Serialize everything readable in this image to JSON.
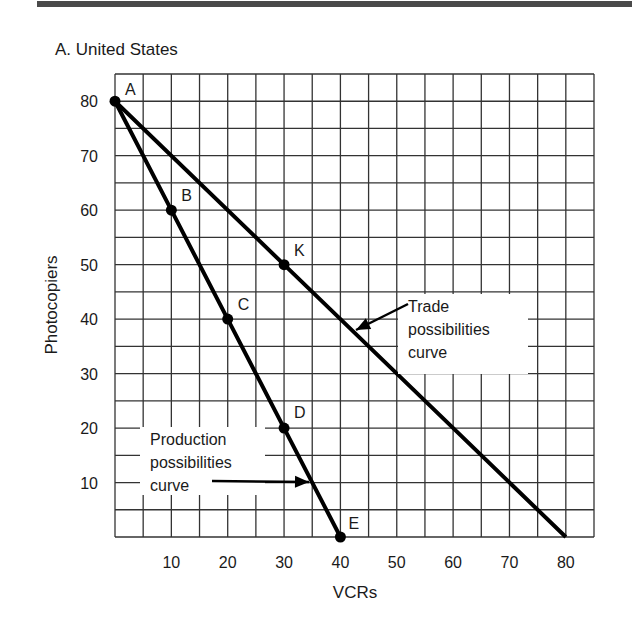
{
  "panel": {
    "title": "A. United States"
  },
  "chart_data": {
    "type": "line",
    "title": "A. United States",
    "xlabel": "VCRs",
    "ylabel": "Photocopiers",
    "xlim": [
      0,
      85
    ],
    "ylim": [
      0,
      85
    ],
    "grid": true,
    "grid_step": 5,
    "x_ticks": [
      10,
      20,
      30,
      40,
      50,
      60,
      70,
      80
    ],
    "y_ticks": [
      10,
      20,
      30,
      40,
      50,
      60,
      70,
      80
    ],
    "series": [
      {
        "name": "Production possibilities curve",
        "points": [
          {
            "label": "A",
            "x": 0,
            "y": 80
          },
          {
            "label": "B",
            "x": 10,
            "y": 60
          },
          {
            "label": "C",
            "x": 20,
            "y": 40
          },
          {
            "label": "D",
            "x": 30,
            "y": 20
          },
          {
            "label": "E",
            "x": 40,
            "y": 0
          }
        ]
      },
      {
        "name": "Trade possibilities curve",
        "points": [
          {
            "label": "A",
            "x": 0,
            "y": 80
          },
          {
            "label": "K",
            "x": 30,
            "y": 50
          },
          {
            "label": "",
            "x": 80,
            "y": 0
          }
        ]
      }
    ],
    "annotations": [
      {
        "text": [
          "Trade",
          "possibilities",
          "curve"
        ],
        "arrow_to": {
          "x": 42,
          "y": 38
        },
        "text_pos": {
          "x": 52,
          "y": 43
        }
      },
      {
        "text": [
          "Production",
          "possibilities",
          "curve"
        ],
        "arrow_to": {
          "x": 35,
          "y": 10
        },
        "text_pos": {
          "x": 6,
          "y": 16
        }
      }
    ]
  }
}
